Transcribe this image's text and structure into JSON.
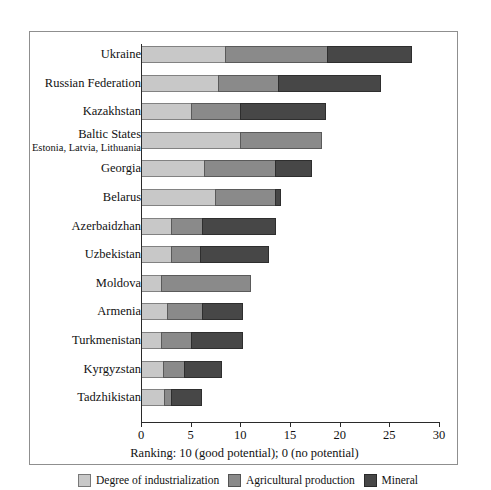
{
  "chart_data": {
    "type": "bar",
    "orientation": "horizontal",
    "stacked": true,
    "title": "",
    "xlabel": "Ranking: 10 (good potential); 0 (no potential)",
    "ylabel": "",
    "xlim": [
      0,
      30
    ],
    "xticks": [
      "0",
      "5",
      "10",
      "15",
      "20",
      "25",
      "30"
    ],
    "grid": false,
    "legend_position": "bottom",
    "categories": [
      "Ukraine",
      "Russian Federation",
      "Kazakhstan",
      "Baltic States",
      "Georgia",
      "Belarus",
      "Azerbaidzhan",
      "Uzbekistan",
      "Moldova",
      "Armenia",
      "Turkmenistan",
      "Kyrgyzstan",
      "Tadzhikistan"
    ],
    "category_sublabels": {
      "Baltic States": "Estonia, Latvia, Lithuania"
    },
    "series": [
      {
        "name": "Degree of industrialization",
        "color": "#c8c8c8",
        "values": [
          8.5,
          7.8,
          5.0,
          10.0,
          6.3,
          7.4,
          3.0,
          3.0,
          2.0,
          2.6,
          2.0,
          2.2,
          2.3
        ]
      },
      {
        "name": "Agricultural production",
        "color": "#8a8a8a",
        "values": [
          10.2,
          6.0,
          5.0,
          8.2,
          7.2,
          6.1,
          3.1,
          2.9,
          9.1,
          3.5,
          3.0,
          2.1,
          0.7
        ]
      },
      {
        "name": "Mineral",
        "color": "#474747",
        "values": [
          8.6,
          10.4,
          8.6,
          0.0,
          3.7,
          0.6,
          7.5,
          7.0,
          0.0,
          4.2,
          5.3,
          3.9,
          3.1
        ]
      }
    ],
    "totals": [
      27.3,
      24.2,
      18.6,
      18.2,
      17.2,
      14.1,
      13.6,
      12.9,
      11.1,
      10.3,
      10.3,
      8.2,
      6.1
    ]
  }
}
